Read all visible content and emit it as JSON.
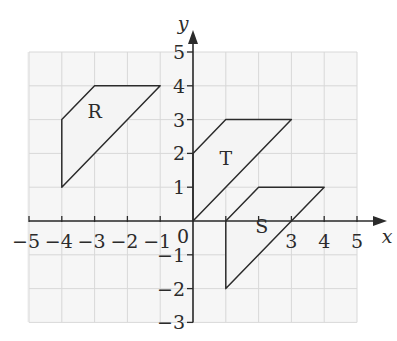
{
  "diagram": {
    "type": "coordinate-grid",
    "axes": {
      "x_label": "x",
      "y_label": "y",
      "x_range": [
        -5,
        5
      ],
      "y_range": [
        -3,
        5
      ],
      "x_ticks": [
        "-5",
        "-4",
        "-3",
        "-2",
        "-1",
        "3",
        "4",
        "5"
      ],
      "y_ticks": [
        "5",
        "4",
        "3",
        "2",
        "1",
        "-1",
        "-2",
        "-3"
      ],
      "origin_label": "0"
    },
    "shapes": [
      {
        "name": "R",
        "label_pos": [
          -3,
          3.2
        ],
        "vertices": [
          [
            -4,
            1
          ],
          [
            -4,
            3
          ],
          [
            -3,
            4
          ],
          [
            -1,
            4
          ]
        ]
      },
      {
        "name": "T",
        "label_pos": [
          1,
          1.8
        ],
        "vertices": [
          [
            0,
            0
          ],
          [
            0,
            2
          ],
          [
            1,
            3
          ],
          [
            3,
            3
          ]
        ]
      },
      {
        "name": "S",
        "label_pos": [
          2.1,
          -0.2
        ],
        "vertices": [
          [
            1,
            -2
          ],
          [
            1,
            0
          ],
          [
            2,
            1
          ],
          [
            4,
            1
          ]
        ]
      }
    ],
    "colors": {
      "grid": "#d8d8d8",
      "grid_fill": "#f4f4f4",
      "shape_fill": "#f4f4f4",
      "stroke": "#2b2b2b"
    }
  }
}
